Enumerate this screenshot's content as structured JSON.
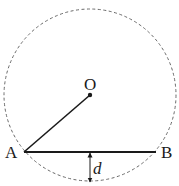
{
  "diagram": {
    "type": "geometry-circle-chord",
    "colors": {
      "stroke": "#1a1a1a",
      "circle": "#6a6a6a",
      "background": "#ffffff"
    },
    "circle": {
      "cx": 90,
      "cy": 95,
      "r": 86,
      "style": "dashed"
    },
    "points": {
      "O": {
        "label": "O",
        "x": 90,
        "y": 95
      },
      "A": {
        "label": "A",
        "x": 24,
        "y": 152
      },
      "B": {
        "label": "B",
        "x": 156,
        "y": 152
      }
    },
    "segments": [
      {
        "from": "O",
        "to": "A",
        "name": "radius-OA"
      },
      {
        "from": "A",
        "to": "B",
        "name": "chord-AB"
      }
    ],
    "distance": {
      "label": "d",
      "x": 90,
      "y1": 152,
      "y2": 181
    }
  }
}
